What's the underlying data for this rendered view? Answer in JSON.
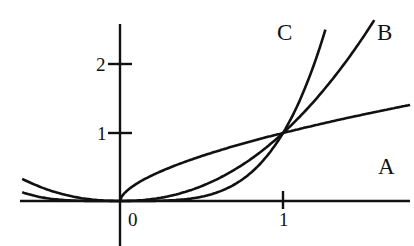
{
  "chart_data": {
    "type": "line",
    "title": "",
    "xlabel": "",
    "ylabel": "",
    "xlim": [
      -0.6,
      1.78
    ],
    "ylim": [
      -0.66,
      2.6
    ],
    "grid": false,
    "x_ticks": [
      {
        "value": 0,
        "label": "0"
      },
      {
        "value": 1,
        "label": "1"
      }
    ],
    "y_ticks": [
      {
        "value": 1,
        "label": "1"
      },
      {
        "value": 2,
        "label": "2"
      }
    ],
    "series": [
      {
        "name": "A",
        "function": "x^0.6 (x >= 0)",
        "domain": [
          0,
          1.78
        ],
        "label_position": [
          1.75,
          0.55
        ]
      },
      {
        "name": "B",
        "function": "|x|^2.2",
        "domain": [
          -0.6,
          1.56
        ],
        "label_position": [
          1.62,
          2.6
        ]
      },
      {
        "name": "C",
        "function": "|x|^4",
        "domain": [
          -0.6,
          1.26
        ],
        "label_position": [
          1.04,
          2.6
        ]
      }
    ],
    "intersections": [
      {
        "x": 0,
        "y": 0
      },
      {
        "x": 1,
        "y": 1
      }
    ],
    "annotations": [
      "A",
      "B",
      "C"
    ]
  },
  "labels": {
    "origin": "0",
    "x_one": "1",
    "y_one": "1",
    "y_two": "2",
    "curve_a": "A",
    "curve_b": "B",
    "curve_c": "C"
  },
  "colors": {
    "ink": "#111111",
    "background": "#ffffff"
  }
}
